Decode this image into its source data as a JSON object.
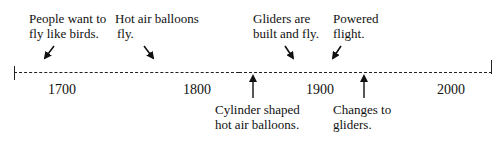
{
  "timeline": {
    "years": [
      "1700",
      "1800",
      "1900",
      "2000"
    ],
    "events_above": [
      {
        "text_line1": "People want to",
        "text_line2": "fly like birds."
      },
      {
        "text_line1": "Hot air balloons",
        "text_line2": "fly."
      },
      {
        "text_line1": "Gliders are",
        "text_line2": "built and fly."
      },
      {
        "text_line1": "Powered",
        "text_line2": "flight."
      }
    ],
    "events_below": [
      {
        "text_line1": "Cylinder shaped",
        "text_line2": "hot air balloons."
      },
      {
        "text_line1": "Changes to",
        "text_line2": "gliders."
      }
    ]
  }
}
